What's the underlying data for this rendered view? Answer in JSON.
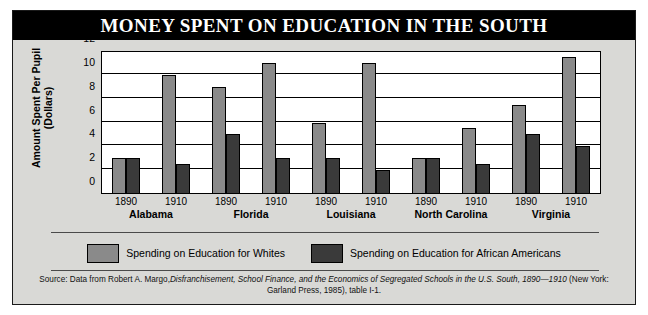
{
  "title": "MONEY SPENT ON EDUCATION IN THE SOUTH",
  "legend": {
    "white_label": "Spending on Education for Whites",
    "black_label": "Spending on Education for African Americans"
  },
  "source": {
    "prefix": "Source: Data from Robert A. Margo,",
    "italic1": "Disfranchisement, School Finance, and the Economics of Segregated Schools in the U.S. South, 1890—1910",
    "suffix": "(New York: Garland Press, 1985), table I-1."
  },
  "colors": {
    "whites_bar": "#8a8a8a",
    "african_americans_bar": "#3a3a3a",
    "panel_background": "#d9d9d6",
    "title_background": "#000000",
    "title_text": "#ffffff"
  },
  "chart_data": {
    "type": "bar",
    "title": "MONEY SPENT ON EDUCATION IN THE SOUTH",
    "xlabel": "",
    "ylabel": "Amount Spent Per Pupil (Dollars)",
    "ylim": [
      0,
      12
    ],
    "yticks": [
      0,
      2,
      4,
      6,
      8,
      10,
      12
    ],
    "grid": true,
    "legend_position": "bottom",
    "groups": [
      "Alabama",
      "Florida",
      "Louisiana",
      "North Carolina",
      "Virginia"
    ],
    "years": [
      "1890",
      "1910"
    ],
    "series": [
      {
        "name": "Spending on Education for Whites",
        "color": "#8a8a8a",
        "values_by_group": {
          "Alabama": {
            "1890": 3.0,
            "1910": 10.0
          },
          "Florida": {
            "1890": 9.0,
            "1910": 11.0
          },
          "Louisiana": {
            "1890": 6.0,
            "1910": 11.0
          },
          "North Carolina": {
            "1890": 3.0,
            "1910": 5.5
          },
          "Virginia": {
            "1890": 7.5,
            "1910": 11.5
          }
        }
      },
      {
        "name": "Spending on Education for African Americans",
        "color": "#3a3a3a",
        "values_by_group": {
          "Alabama": {
            "1890": 3.0,
            "1910": 2.5
          },
          "Florida": {
            "1890": 5.0,
            "1910": 3.0
          },
          "Louisiana": {
            "1890": 3.0,
            "1910": 2.0
          },
          "North Carolina": {
            "1890": 3.0,
            "1910": 2.5
          },
          "Virginia": {
            "1890": 5.0,
            "1910": 4.0
          }
        }
      }
    ]
  }
}
